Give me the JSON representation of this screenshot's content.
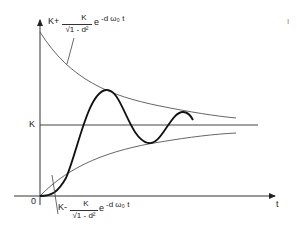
{
  "diagram": {
    "type": "damped-oscillation-step-response",
    "axes": {
      "x_label": "t",
      "origin_label": "0",
      "y_level_label": "K"
    },
    "annotations": {
      "upper_envelope": {
        "prefix": "K+",
        "numerator": "K",
        "denominator": "√1 - d²",
        "exponent_term": "e",
        "exponent": "-d ω₀ t"
      },
      "lower_envelope": {
        "prefix": "K-",
        "numerator": "K",
        "denominator": "√1 - d²",
        "exponent_term": "e",
        "exponent": "-d ω₀ t"
      }
    },
    "page_marker": "I",
    "colors": {
      "axis": "#333333",
      "envelope": "#555555",
      "response": "#111111"
    }
  }
}
